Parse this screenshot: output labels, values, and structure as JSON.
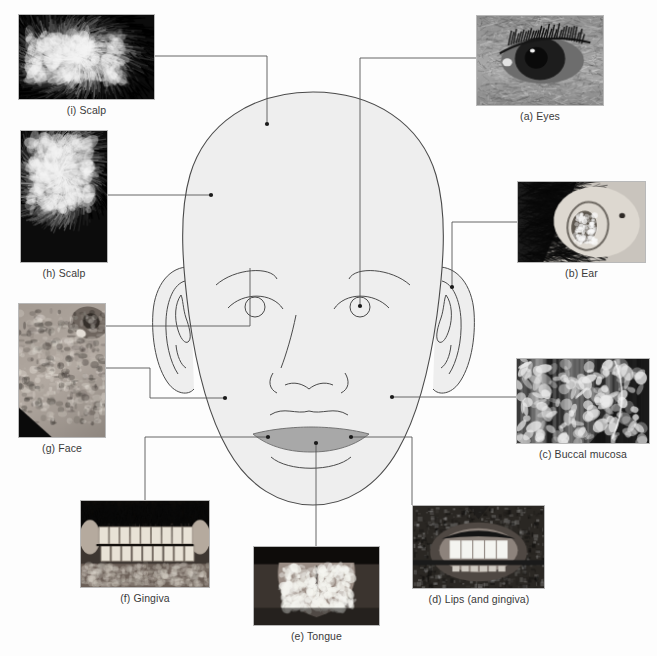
{
  "figure": {
    "background_color": "#fdfdfd",
    "line_color": "#555555",
    "face_fill": "#eeeeee",
    "face_stroke": "#4a4a4a",
    "mouth_fill": "#a8a8a8",
    "caption_color": "#3a3a3a"
  },
  "panels": [
    {
      "id": "a",
      "key": "eyes",
      "caption": "(a) Eyes",
      "photo_name": "photo-eyes",
      "caption_name": "caption-eyes",
      "rect": {
        "x": 476,
        "y": 15,
        "w": 128,
        "h": 91
      },
      "caption_pos": {
        "x": 476,
        "y": 110,
        "w": 128
      },
      "target": {
        "x": 360,
        "y": 306
      },
      "photo_style": "eye"
    },
    {
      "id": "b",
      "key": "ear",
      "caption": "(b) Ear",
      "photo_name": "photo-ear",
      "caption_name": "caption-ear",
      "rect": {
        "x": 517,
        "y": 181,
        "w": 129,
        "h": 82
      },
      "caption_pos": {
        "x": 517,
        "y": 267,
        "w": 129
      },
      "target": {
        "x": 452,
        "y": 287
      },
      "photo_style": "ear"
    },
    {
      "id": "c",
      "key": "buccal",
      "caption": "(c) Buccal mucosa",
      "photo_name": "photo-buccal-mucosa",
      "caption_name": "caption-buccal-mucosa",
      "rect": {
        "x": 516,
        "y": 358,
        "w": 134,
        "h": 86
      },
      "caption_pos": {
        "x": 516,
        "y": 448,
        "w": 134
      },
      "target": {
        "x": 392,
        "y": 397
      },
      "photo_style": "buccal"
    },
    {
      "id": "d",
      "key": "lips",
      "caption": "(d) Lips (and gingiva)",
      "photo_name": "photo-lips-and-gingiva",
      "caption_name": "caption-lips-and-gingiva",
      "rect": {
        "x": 412,
        "y": 505,
        "w": 133,
        "h": 84
      },
      "caption_pos": {
        "x": 400,
        "y": 593,
        "w": 158
      },
      "target": {
        "x": 351,
        "y": 437
      },
      "photo_style": "lips"
    },
    {
      "id": "e",
      "key": "tongue",
      "caption": "(e) Tongue",
      "photo_name": "photo-tongue",
      "caption_name": "caption-tongue",
      "rect": {
        "x": 253,
        "y": 546,
        "w": 127,
        "h": 80
      },
      "caption_pos": {
        "x": 253,
        "y": 630,
        "w": 127
      },
      "target": {
        "x": 316,
        "y": 443
      },
      "photo_style": "tongue"
    },
    {
      "id": "f",
      "key": "gingiva",
      "caption": "(f) Gingiva",
      "photo_name": "photo-gingiva",
      "caption_name": "caption-gingiva",
      "rect": {
        "x": 80,
        "y": 500,
        "w": 130,
        "h": 88
      },
      "caption_pos": {
        "x": 80,
        "y": 592,
        "w": 130
      },
      "target": {
        "x": 268,
        "y": 437
      },
      "photo_style": "gingiva"
    },
    {
      "id": "g",
      "key": "face",
      "caption": "(g) Face",
      "photo_name": "photo-face",
      "caption_name": "caption-face",
      "rect": {
        "x": 18,
        "y": 303,
        "w": 88,
        "h": 135
      },
      "caption_pos": {
        "x": 18,
        "y": 442,
        "w": 88
      },
      "target": {
        "x": 225,
        "y": 398
      },
      "photo_style": "face"
    },
    {
      "id": "h",
      "key": "scalp-h",
      "caption": "(h) Scalp",
      "photo_name": "photo-scalp-h",
      "caption_name": "caption-scalp-h",
      "rect": {
        "x": 20,
        "y": 130,
        "w": 88,
        "h": 133
      },
      "caption_pos": {
        "x": 20,
        "y": 267,
        "w": 88
      },
      "target": {
        "x": 211,
        "y": 195
      },
      "photo_style": "scalp-h"
    },
    {
      "id": "i",
      "key": "scalp-i",
      "caption": "(i) Scalp",
      "photo_name": "photo-scalp-i",
      "caption_name": "caption-scalp-i",
      "rect": {
        "x": 18,
        "y": 14,
        "w": 137,
        "h": 86
      },
      "caption_pos": {
        "x": 18,
        "y": 104,
        "w": 137
      },
      "target": {
        "x": 267,
        "y": 124
      },
      "photo_style": "scalp-i"
    }
  ],
  "leaders": [
    {
      "name": "leader-eyes",
      "points": [
        [
          476,
          58
        ],
        [
          360,
          58
        ],
        [
          360,
          306
        ]
      ]
    },
    {
      "name": "leader-ear",
      "points": [
        [
          517,
          222
        ],
        [
          452,
          222
        ],
        [
          452,
          287
        ]
      ]
    },
    {
      "name": "leader-buccal",
      "points": [
        [
          516,
          397
        ],
        [
          392,
          397
        ]
      ]
    },
    {
      "name": "leader-lips",
      "points": [
        [
          412,
          505
        ],
        [
          412,
          437
        ],
        [
          351,
          437
        ]
      ]
    },
    {
      "name": "leader-tongue",
      "points": [
        [
          316,
          546
        ],
        [
          316,
          443
        ]
      ]
    },
    {
      "name": "leader-gingiva",
      "points": [
        [
          145,
          500
        ],
        [
          145,
          437
        ],
        [
          268,
          437
        ]
      ]
    },
    {
      "name": "leader-face",
      "points": [
        [
          106,
          368
        ],
        [
          150,
          368
        ],
        [
          150,
          398
        ],
        [
          225,
          398
        ]
      ]
    },
    {
      "name": "leader-face-brow",
      "points": [
        [
          106,
          326
        ],
        [
          250,
          326
        ],
        [
          250,
          268
        ]
      ]
    },
    {
      "name": "leader-scalp-h",
      "points": [
        [
          108,
          195
        ],
        [
          211,
          195
        ]
      ]
    },
    {
      "name": "leader-scalp-i",
      "points": [
        [
          155,
          56
        ],
        [
          267,
          56
        ],
        [
          267,
          124
        ]
      ]
    }
  ],
  "anatomy": {
    "head_outline_name": "head-outline",
    "left_ear_name": "left-ear",
    "right_ear_name": "right-ear",
    "left_eye_name": "left-eye",
    "right_eye_name": "right-eye",
    "left_eyebrow_name": "left-eyebrow",
    "right_eyebrow_name": "right-eyebrow",
    "nose_name": "nose",
    "upper_lip_name": "upper-lip",
    "open_mouth_name": "open-mouth",
    "chin_crease_name": "chin-crease"
  }
}
